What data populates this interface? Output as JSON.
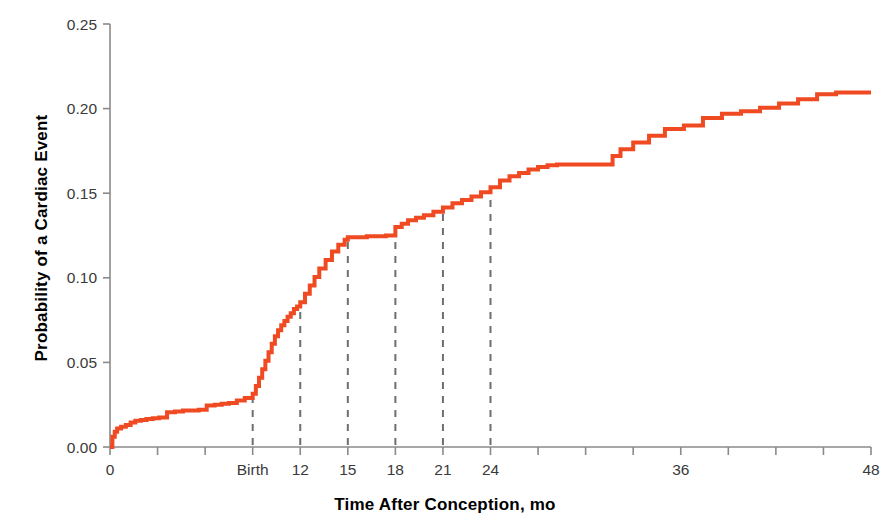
{
  "chart_data": {
    "type": "line",
    "title": "",
    "subtitle": "",
    "xlabel": "Time After Conception, mo",
    "ylabel": "Probability of a Cardiac Event",
    "xlim": [
      0,
      48
    ],
    "ylim": [
      0.0,
      0.25
    ],
    "grid": false,
    "legend": "none",
    "line_color": "#F04A23",
    "line_width_px": 4,
    "step_type": "post",
    "xticks": [
      0,
      3,
      6,
      9,
      12,
      15,
      18,
      21,
      24,
      27,
      30,
      33,
      36,
      39,
      42,
      45,
      48
    ],
    "xtick_labels": [
      "0",
      "",
      "",
      "Birth",
      "12",
      "15",
      "18",
      "21",
      "24",
      "",
      "",
      "",
      "36",
      "",
      "",
      "",
      "48"
    ],
    "yticks": [
      0.0,
      0.05,
      0.1,
      0.15,
      0.2,
      0.25
    ],
    "ytick_labels": [
      "0.00",
      "0.05",
      "0.10",
      "0.15",
      "0.20",
      "0.25"
    ],
    "annotations": [
      {
        "label": "Birth",
        "x": 9,
        "y": 0.0315,
        "style": "dashed-vertical-to-curve"
      },
      {
        "label": "12",
        "x": 12,
        "y": 0.0855,
        "style": "dashed-vertical-to-curve"
      },
      {
        "label": "15",
        "x": 15,
        "y": 0.124,
        "style": "dashed-vertical-to-curve"
      },
      {
        "label": "18",
        "x": 18,
        "y": 0.13,
        "style": "dashed-vertical-to-curve"
      },
      {
        "label": "21",
        "x": 21,
        "y": 0.1415,
        "style": "dashed-vertical-to-curve"
      },
      {
        "label": "24",
        "x": 24,
        "y": 0.1535,
        "style": "dashed-vertical-to-curve"
      }
    ],
    "series": [
      {
        "name": "Cumulative probability of a cardiac event",
        "x": [
          0.0,
          0.15,
          0.3,
          0.45,
          0.7,
          1.0,
          1.3,
          1.6,
          1.95,
          2.3,
          2.7,
          3.1,
          3.6,
          4.1,
          4.6,
          5.1,
          5.6,
          6.1,
          6.6,
          7.05,
          7.5,
          8.0,
          8.5,
          9.0,
          9.2,
          9.4,
          9.6,
          9.8,
          10.0,
          10.2,
          10.4,
          10.6,
          10.8,
          11.0,
          11.2,
          11.4,
          11.6,
          11.8,
          12.0,
          12.3,
          12.6,
          12.9,
          13.2,
          13.6,
          14.0,
          14.4,
          14.8,
          15.0,
          16.2,
          17.4,
          18.0,
          18.4,
          18.8,
          19.3,
          19.8,
          20.4,
          21.0,
          21.6,
          22.2,
          22.8,
          23.4,
          24.0,
          24.6,
          25.2,
          25.8,
          26.4,
          27.0,
          27.6,
          28.2,
          31.2,
          31.7,
          32.2,
          33.0,
          34.0,
          35.0,
          36.2,
          37.4,
          38.6,
          39.8,
          41.0,
          42.2,
          43.4,
          44.6,
          45.8,
          48.0
        ],
        "y": [
          0.0,
          0.006,
          0.009,
          0.011,
          0.012,
          0.013,
          0.0145,
          0.0155,
          0.016,
          0.0165,
          0.017,
          0.0175,
          0.0205,
          0.021,
          0.0215,
          0.0215,
          0.022,
          0.0245,
          0.025,
          0.0255,
          0.026,
          0.0275,
          0.029,
          0.0315,
          0.036,
          0.041,
          0.046,
          0.051,
          0.056,
          0.061,
          0.0655,
          0.069,
          0.072,
          0.0745,
          0.077,
          0.079,
          0.0815,
          0.083,
          0.0855,
          0.0905,
          0.0955,
          0.1005,
          0.1055,
          0.1105,
          0.1155,
          0.1195,
          0.1225,
          0.124,
          0.1245,
          0.125,
          0.13,
          0.132,
          0.134,
          0.1355,
          0.137,
          0.139,
          0.1415,
          0.144,
          0.146,
          0.148,
          0.1505,
          0.1535,
          0.1575,
          0.16,
          0.162,
          0.164,
          0.1655,
          0.1665,
          0.167,
          0.167,
          0.172,
          0.176,
          0.18,
          0.184,
          0.188,
          0.19,
          0.1945,
          0.197,
          0.1985,
          0.2005,
          0.203,
          0.2055,
          0.2085,
          0.2095,
          0.2095
        ]
      }
    ]
  },
  "figure": {
    "xlabel": "Time After Conception, mo",
    "ylabel": "Probability of a Cardiac Event"
  }
}
